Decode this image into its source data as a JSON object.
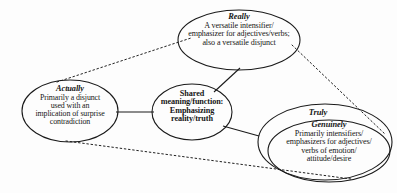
{
  "diagram": {
    "type": "venn-concept-map",
    "background_color": "#fdfdfd",
    "stroke_color": "#1a1a1a",
    "nodes": [
      {
        "id": "really",
        "title": "Really",
        "lines": [
          "A versatile intensifier/",
          "emphasizer for adjectives/verbs;",
          "also a versatile disjunct"
        ]
      },
      {
        "id": "actually",
        "title": "Actually",
        "lines": [
          "Primarily a disjunct",
          "used with an",
          "implication of surprise",
          "contradiction"
        ]
      },
      {
        "id": "shared",
        "title": "",
        "lines": [
          "Shared",
          "meaning/function:",
          "Emphasizing",
          "reality/truth"
        ]
      },
      {
        "id": "truly",
        "title": "Truly",
        "lines": []
      },
      {
        "id": "genuinely",
        "title": "Genuinely",
        "lines": [
          "Primarily intensifiers/",
          "emphasizers for adjectives/",
          "verbs of emotion/",
          "attitude/desire"
        ]
      }
    ],
    "connectors": [
      {
        "from": "actually",
        "to": "shared",
        "style": "solid"
      },
      {
        "from": "shared",
        "to": "really",
        "style": "solid"
      },
      {
        "from": "shared",
        "to": "truly",
        "style": "solid"
      },
      {
        "from": "actually",
        "to": "really",
        "style": "dotted"
      },
      {
        "from": "actually",
        "to": "genuinely",
        "style": "dotted"
      },
      {
        "from": "really",
        "to": "genuinely",
        "style": "dotted"
      }
    ]
  },
  "really": {
    "title": "Really",
    "line1": "A versatile intensifier/",
    "line2": "emphasizer for adjectives/verbs;",
    "line3": "also a versatile disjunct"
  },
  "actually": {
    "title": "Actually",
    "line1": "Primarily a disjunct",
    "line2": "used with an",
    "line3": "implication of surprise",
    "line4": "contradiction"
  },
  "shared": {
    "line1": "Shared",
    "line2": "meaning/function:",
    "line3": "Emphasizing",
    "line4": "reality/truth"
  },
  "truly": {
    "title": "Truly"
  },
  "genuinely": {
    "title": "Genuinely",
    "line1": "Primarily intensifiers/",
    "line2": "emphasizers for adjectives/",
    "line3": "verbs of emotion/",
    "line4": "attitude/desire"
  }
}
